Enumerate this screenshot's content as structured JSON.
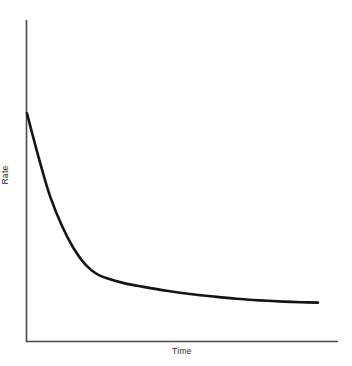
{
  "figure": {
    "background_color": "#ffffff",
    "axis_color": "#4a4a4a",
    "curve_color": "#141414"
  },
  "chart_data": {
    "type": "line",
    "title": "",
    "subtitle": "",
    "xlabel": "Time",
    "ylabel": "Rate",
    "grid": false,
    "legend": null,
    "annotations": [],
    "xlim": [
      0,
      100
    ],
    "ylim": [
      0,
      100
    ],
    "axis_ticks": {
      "x": [],
      "y": []
    },
    "series": [
      {
        "name": "Rate",
        "color": "#141414",
        "line_width": 2.6,
        "x": [
          0,
          2,
          5,
          8,
          12,
          16,
          20,
          24,
          28,
          34,
          40,
          48,
          56,
          64,
          72,
          80,
          88,
          94,
          100
        ],
        "y": [
          71,
          64,
          54,
          45,
          36,
          29,
          24,
          21,
          19.5,
          18,
          17,
          15.8,
          14.8,
          14.0,
          13.3,
          12.8,
          12.4,
          12.2,
          12.1
        ],
        "description": "Monotonically decreasing exponential-decay curve: steep initial drop followed by a pronounced knee and a long, nearly flat asymptotic tail."
      }
    ]
  }
}
